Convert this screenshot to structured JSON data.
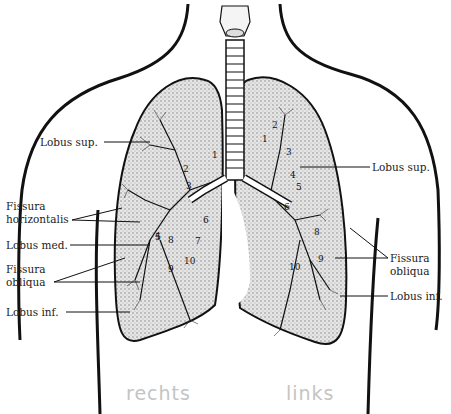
{
  "labels_right_lung": {
    "lobus_sup": "Lobus sup.",
    "fissura_horizontalis_1": "Fissura",
    "fissura_horizontalis_2": "horizontalis",
    "lobus_med": "Lobus med.",
    "fissura_obliqua_1": "Fissura",
    "fissura_obliqua_2": "obliqua",
    "lobus_inf": "Lobus inf."
  },
  "labels_left_lung": {
    "lobus_sup": "Lobus sup.",
    "fissura_obliqua_1": "Fissura",
    "fissura_obliqua_2": "obliqua",
    "lobus_inf": "Lobus inf."
  },
  "handwritten": {
    "right": "rechts",
    "left": "links"
  },
  "segment_numbers_right": [
    "1",
    "2",
    "3",
    "4",
    "5",
    "6",
    "7",
    "8",
    "9",
    "10"
  ],
  "segment_numbers_left": [
    "1",
    "2",
    "3",
    "4",
    "5",
    "6",
    "8",
    "9",
    "10"
  ]
}
